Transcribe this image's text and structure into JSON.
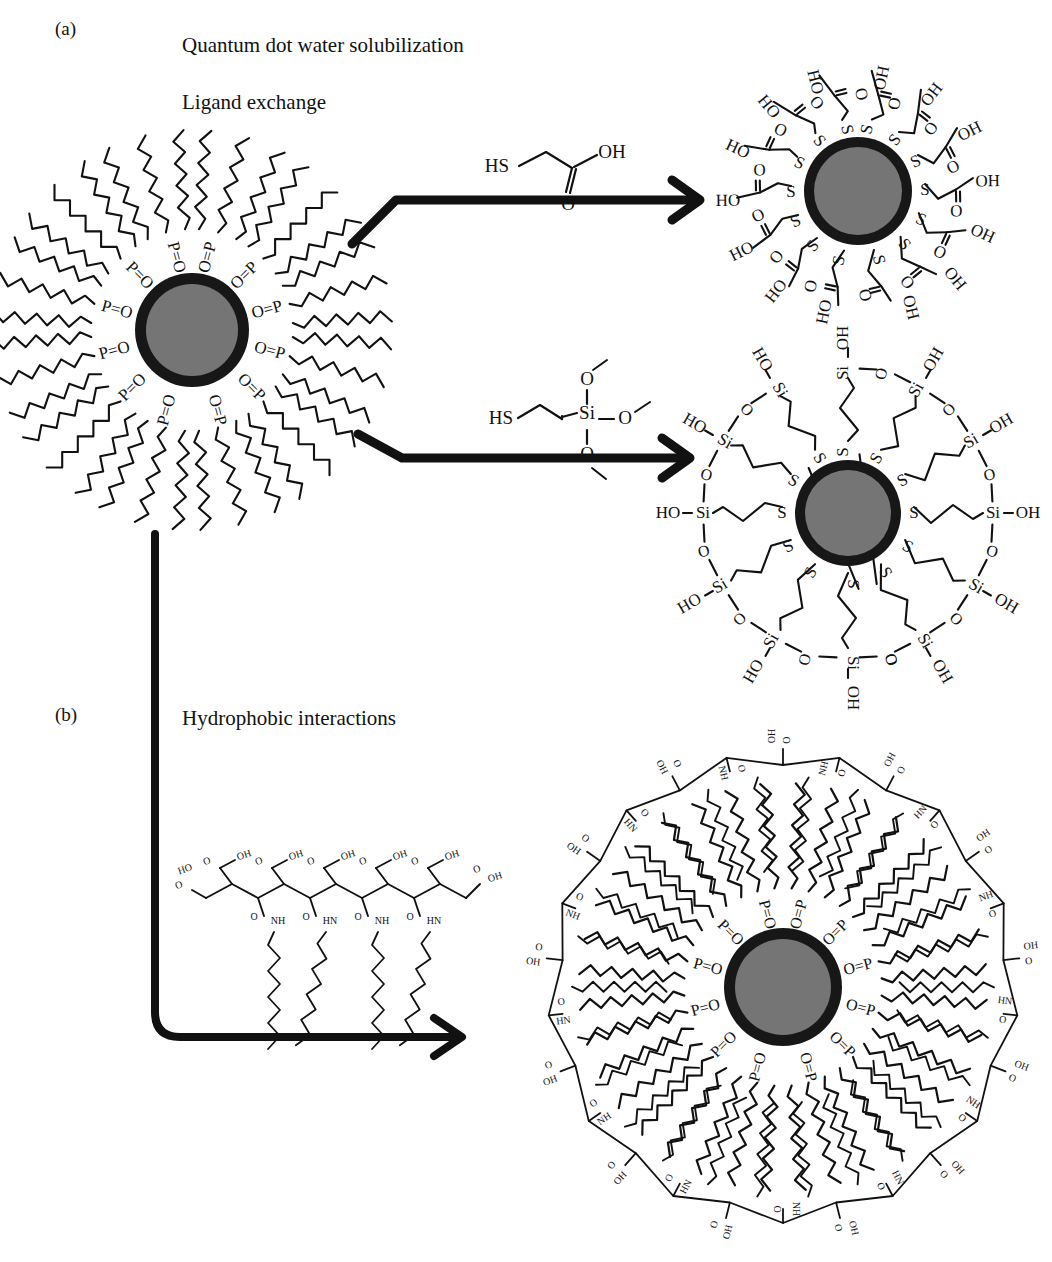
{
  "figure": {
    "panels": [
      {
        "id": "a",
        "label": "(a)",
        "heading": "Quantum dot water solubilization",
        "subheading": "Ligand exchange"
      },
      {
        "id": "b",
        "label": "(b)",
        "heading": "Hydrophobic interactions"
      }
    ]
  },
  "labels": {
    "panel_a": "(a)",
    "panel_b": "(b)",
    "title_main": "Quantum dot water solubilization",
    "title_ligand": "Ligand exchange",
    "title_hydrophobic": "Hydrophobic interactions"
  },
  "atoms": {
    "P": "P",
    "O": "O",
    "S": "S",
    "Si": "Si",
    "N": "N",
    "H": "H",
    "po_left": "P=O",
    "po_right": "O=P",
    "oh": "OH",
    "ho": "HO",
    "hs": "HS",
    "nh": "NH",
    "hn": "HN",
    "si_oh": "Si",
    "c_o": "O"
  },
  "reagents": [
    {
      "name": "mercaptoacetic-acid",
      "formula_parts": [
        "HS",
        "OH",
        "O"
      ]
    },
    {
      "name": "mercaptopropyl-trimethoxysilane",
      "formula_parts": [
        "HS",
        "Si",
        "O",
        "O",
        "O"
      ]
    },
    {
      "name": "amphiphilic-polymer",
      "formula_parts": [
        "OH",
        "O",
        "NH",
        "HN"
      ]
    }
  ],
  "particles": [
    {
      "name": "topo-capped-quantum-dot",
      "ligand": "P=O",
      "arms": 12,
      "chains_per_arm": 3,
      "core_color": "#757575",
      "shell_color": "#171717"
    },
    {
      "name": "mercaptoacetic-acid-capped-quantum-dot",
      "ligand": "S",
      "arms": 14,
      "core_color": "#757575",
      "shell_color": "#171717"
    },
    {
      "name": "silica-coated-quantum-dot",
      "ligand": "S",
      "arms": 12,
      "shell_group": "Si-OH",
      "core_color": "#757575",
      "shell_color": "#171717"
    },
    {
      "name": "polymer-encapsulated-quantum-dot",
      "ligand": "P=O",
      "arms": 12,
      "core_color": "#757575",
      "shell_color": "#171717"
    }
  ],
  "colors": {
    "ink": "#111111",
    "core": "#757575",
    "shell": "#171717",
    "background": "#ffffff"
  }
}
